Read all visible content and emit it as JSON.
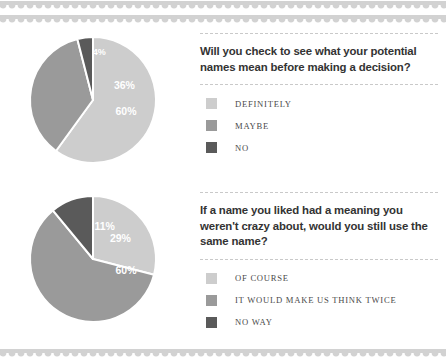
{
  "page": {
    "background": "#ffffff",
    "border_color": "#d2d2d2"
  },
  "palette": {
    "light": "#cdcdcd",
    "medium": "#9a9a9a",
    "dark": "#5a5a5a",
    "separator": "#ffffff",
    "rule": "#c9c9c9",
    "question_text": "#333333",
    "legend_text": "#4a4a4a"
  },
  "sections": [
    {
      "question": "Will you check to see what your potential names mean before making a decision?",
      "legend": [
        {
          "label": "DEFINITELY",
          "color": "#cdcdcd"
        },
        {
          "label": "MAYBE",
          "color": "#9a9a9a"
        },
        {
          "label": "NO",
          "color": "#5a5a5a"
        }
      ],
      "chart_data": {
        "type": "pie",
        "title": "Will you check to see what your potential names mean before making a decision?",
        "labels": [
          "DEFINITELY",
          "MAYBE",
          "NO"
        ],
        "values": [
          60,
          36,
          4
        ],
        "value_labels": [
          "60%",
          "36%",
          "4%"
        ],
        "colors": [
          "#cdcdcd",
          "#9a9a9a",
          "#5a5a5a"
        ],
        "units": "percent",
        "start_angle_deg": 0,
        "direction": "clockwise",
        "legend_position": "right",
        "grid": false
      }
    },
    {
      "question": "If a name you liked had a meaning you weren't crazy about, would you still use the same name?",
      "legend": [
        {
          "label": "OF COURSE",
          "color": "#cdcdcd"
        },
        {
          "label": "IT WOULD MAKE US THINK TWICE",
          "color": "#9a9a9a"
        },
        {
          "label": "NO WAY",
          "color": "#5a5a5a"
        }
      ],
      "chart_data": {
        "type": "pie",
        "title": "If a name you liked had a meaning you weren't crazy about, would you still use the same name?",
        "labels": [
          "OF COURSE",
          "IT WOULD MAKE US THINK TWICE",
          "NO WAY"
        ],
        "values": [
          29,
          60,
          11
        ],
        "value_labels": [
          "29%",
          "60%",
          "11%"
        ],
        "colors": [
          "#cdcdcd",
          "#9a9a9a",
          "#5a5a5a"
        ],
        "units": "percent",
        "start_angle_deg": 0,
        "direction": "clockwise",
        "legend_position": "right",
        "grid": false
      }
    }
  ]
}
